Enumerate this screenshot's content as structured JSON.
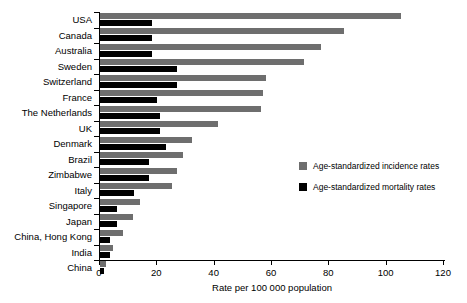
{
  "chart_data": {
    "type": "bar",
    "orientation": "horizontal",
    "title": "",
    "xlabel": "Rate per 100 000 population",
    "ylabel": "",
    "xlim": [
      0,
      120
    ],
    "xticks": [
      0,
      20,
      40,
      60,
      80,
      100,
      120
    ],
    "grid": false,
    "legend_position": "center-right",
    "categories": [
      "USA",
      "Canada",
      "Australia",
      "Sweden",
      "Switzerland",
      "France",
      "The Netherlands",
      "UK",
      "Denmark",
      "Brazil",
      "Zimbabwe",
      "Italy",
      "Singapore",
      "Japan",
      "China, Hong Kong",
      "India",
      "China"
    ],
    "series": [
      {
        "name": "Age-standardized incidence rates",
        "color": "#6e6e6e",
        "values": [
          105,
          85,
          77,
          71,
          58,
          57,
          56,
          41,
          32,
          29,
          27,
          25,
          14,
          11.5,
          8,
          4.5,
          2
        ]
      },
      {
        "name": "Age-standardized mortality rates",
        "color": "#000000",
        "values": [
          18,
          18,
          18,
          27,
          27,
          20,
          21,
          21,
          23,
          17,
          17,
          12,
          6,
          6,
          3.5,
          3.5,
          1.5
        ]
      }
    ]
  },
  "legend": {
    "items": [
      {
        "label": "Age-standardized incidence rates",
        "color": "#6e6e6e"
      },
      {
        "label": "Age-standardized mortality rates",
        "color": "#000000"
      }
    ]
  }
}
